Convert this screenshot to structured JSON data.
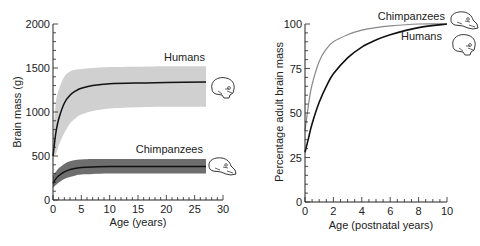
{
  "chart_data": [
    {
      "type": "line",
      "title": "",
      "xlabel": "Age (years)",
      "ylabel": "Brain mass (g)",
      "xlim": [
        0,
        30
      ],
      "ylim": [
        0,
        2000
      ],
      "xticks": [
        "0",
        "5",
        "10",
        "15",
        "20",
        "25",
        "30"
      ],
      "yticks": [
        "0",
        "500",
        "1000",
        "1500",
        "2000"
      ],
      "grid": false,
      "legend": "inline labels at right with skull icons",
      "series": [
        {
          "name": "Humans",
          "x": [
            0,
            0.5,
            1,
            2,
            3,
            4,
            5,
            7,
            10,
            15,
            20,
            27
          ],
          "values": [
            500,
            760,
            920,
            1100,
            1190,
            1240,
            1270,
            1300,
            1320,
            1330,
            1335,
            1340
          ],
          "band_upper": [
            700,
            1100,
            1250,
            1400,
            1460,
            1480,
            1490,
            1500,
            1510,
            1515,
            1520,
            1520
          ],
          "band_lower": [
            500,
            520,
            620,
            760,
            870,
            930,
            970,
            1010,
            1040,
            1055,
            1060,
            1060
          ],
          "color": "#111111",
          "band_color": "#d0d0d0"
        },
        {
          "name": "Chimpanzees",
          "x": [
            0,
            0.5,
            1,
            2,
            3,
            4,
            5,
            7,
            10,
            15,
            20,
            27
          ],
          "values": [
            190,
            240,
            275,
            320,
            345,
            360,
            370,
            375,
            380,
            380,
            380,
            380
          ],
          "band_upper": [
            280,
            320,
            360,
            410,
            440,
            455,
            460,
            465,
            465,
            465,
            465,
            465
          ],
          "band_lower": [
            140,
            170,
            200,
            240,
            260,
            280,
            290,
            295,
            300,
            300,
            300,
            300
          ],
          "color": "#111111",
          "band_color": "#6e6e6e"
        }
      ]
    },
    {
      "type": "line",
      "title": "",
      "xlabel": "Age (postnatal years)",
      "ylabel": "Percentage adult brain mass",
      "xlim": [
        0,
        10
      ],
      "ylim": [
        0,
        100
      ],
      "xticks": [
        "0",
        "2",
        "4",
        "6",
        "8",
        "10"
      ],
      "yticks": [
        "0",
        "25",
        "50",
        "75",
        "100"
      ],
      "grid": false,
      "legend": "inline labels at right with skull icons",
      "series": [
        {
          "name": "Chimpanzees",
          "x": [
            0,
            0.25,
            0.5,
            1,
            1.5,
            2,
            3,
            4,
            5,
            6,
            8,
            10
          ],
          "values": [
            40,
            55,
            66,
            79,
            86,
            90,
            94,
            96.5,
            98,
            99,
            100,
            100
          ],
          "color": "#888888"
        },
        {
          "name": "Humans",
          "x": [
            0,
            0.25,
            0.5,
            1,
            1.5,
            2,
            3,
            4,
            5,
            6,
            8,
            10
          ],
          "values": [
            28,
            36,
            44,
            56,
            65,
            72,
            81,
            87,
            91,
            94,
            98,
            100
          ],
          "color": "#111111"
        }
      ]
    }
  ],
  "labels": {
    "left": {
      "xlabel": "Age (years)",
      "ylabel": "Brain mass (g)",
      "humans": "Humans",
      "chimps": "Chimpanzees",
      "xticks": [
        "0",
        "5",
        "10",
        "15",
        "20",
        "25",
        "30"
      ],
      "yticks": [
        "0",
        "500",
        "1000",
        "1500",
        "2000"
      ]
    },
    "right": {
      "xlabel": "Age (postnatal years)",
      "ylabel": "Percentage adult brain mass",
      "humans": "Humans",
      "chimps": "Chimpanzees",
      "xticks": [
        "0",
        "2",
        "4",
        "6",
        "8",
        "10"
      ],
      "yticks": [
        "0",
        "25",
        "50",
        "75",
        "100"
      ]
    }
  }
}
